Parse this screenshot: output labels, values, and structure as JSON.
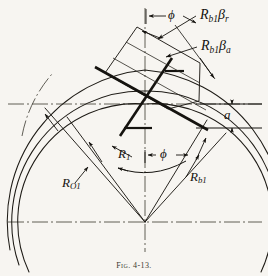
{
  "figure": {
    "caption_prefix": "Fig.",
    "caption_number": "4-13.",
    "caption_full": "Fig. 4-13."
  },
  "colors": {
    "background": "#f7f5f1",
    "ink": "#15130f",
    "ink_light": "#3a372f",
    "thin_line": "#2b2822"
  },
  "labels": {
    "rb1_beta_r": {
      "base": "R",
      "sub1": "b1",
      "greek": "β",
      "sub2": "r"
    },
    "rb1_beta_a": {
      "base": "R",
      "sub1": "b1",
      "greek": "β",
      "sub2": "a"
    },
    "r1": {
      "base": "R",
      "sub1": "1"
    },
    "ro1": {
      "base": "R",
      "sub1": "O1"
    },
    "rb1": {
      "base": "R",
      "sub1": "b1"
    },
    "phi_top": "ϕ",
    "phi_center": "ϕ",
    "a_dim": "a"
  },
  "geometry": {
    "center_x": 145,
    "center_y": 222,
    "pitch_point_x": 145,
    "pitch_point_y": 104,
    "arc_radii": {
      "outer_Ro1": 152,
      "pitch_R1": 131,
      "base_Rb1": 118
    },
    "pressure_angle_deg": 20,
    "addendum_a_label": "a"
  }
}
